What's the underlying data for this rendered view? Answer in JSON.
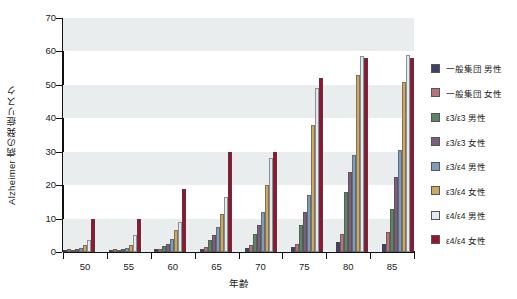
{
  "chart_data": {
    "type": "bar",
    "title": "",
    "xlabel": "年齢",
    "ylabel": "Alzheimer 病の発症リスク",
    "categories": [
      "50",
      "55",
      "60",
      "65",
      "70",
      "75",
      "80",
      "85"
    ],
    "ylim": [
      0,
      70
    ],
    "yticks": [
      0,
      10,
      20,
      30,
      40,
      50,
      60,
      70
    ],
    "grid": "alternating-horizontal-bands",
    "legend_position": "right",
    "series": [
      {
        "name": "一般集団 男性",
        "color": "#3f4266",
        "values": [
          0.5,
          0.5,
          0.8,
          1.0,
          1.2,
          1.5,
          3.0,
          2.5
        ]
      },
      {
        "name": "一般集団 女性",
        "color": "#b5737b",
        "values": [
          0.8,
          0.8,
          1.0,
          1.5,
          2.0,
          2.5,
          5.5,
          6.0
        ]
      },
      {
        "name": "ε3/ε3 男性",
        "color": "#5f8367",
        "values": [
          0.6,
          0.6,
          1.8,
          3.5,
          5.5,
          8.0,
          18.0,
          13.0
        ]
      },
      {
        "name": "ε3/ε3 女性",
        "color": "#7c607a",
        "values": [
          0.8,
          0.9,
          2.5,
          5.0,
          8.0,
          12.0,
          24.0,
          22.5
        ]
      },
      {
        "name": "ε3/ε4 男性",
        "color": "#7f9cba",
        "values": [
          1.2,
          1.3,
          4.0,
          7.5,
          12.0,
          17.0,
          29.0,
          30.5
        ]
      },
      {
        "name": "ε3/ε4 女性",
        "color": "#cda863",
        "values": [
          2.0,
          2.2,
          6.5,
          11.5,
          20.0,
          38.0,
          53.0,
          51.0
        ]
      },
      {
        "name": "ε4/ε4 男性",
        "color": "#dfeaf3",
        "values": [
          3.5,
          5.0,
          9.0,
          16.5,
          28.0,
          49.0,
          58.5,
          59.0
        ]
      },
      {
        "name": "ε4/ε4 女性",
        "color": "#951531",
        "values": [
          10.0,
          10.0,
          19.0,
          30.0,
          30.0,
          52.0,
          58.0,
          58.0
        ]
      }
    ]
  }
}
